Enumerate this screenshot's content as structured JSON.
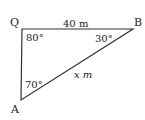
{
  "diagram": {
    "type": "triangle",
    "vertices": {
      "Q": {
        "label": "Q",
        "angle": "80°"
      },
      "B": {
        "label": "B",
        "angle": "30°"
      },
      "A": {
        "label": "A",
        "angle": "70°"
      }
    },
    "sides": {
      "QB": {
        "label": "40 m"
      },
      "AB": {
        "label": "x m"
      }
    },
    "line_color": "#333333"
  }
}
